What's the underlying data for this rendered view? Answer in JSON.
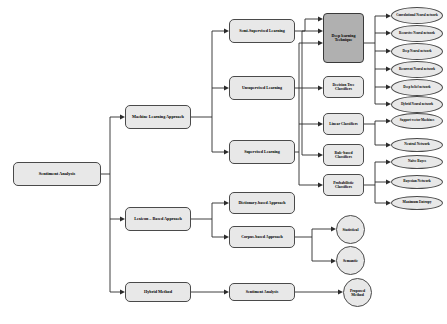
{
  "diagram": {
    "type": "tree",
    "background_color": "#ffffff",
    "node_fill": "#e8e8e8",
    "highlight_fill": "#b0b0b0",
    "border_color": "#4a4a4a"
  },
  "root": {
    "label": "Sentiment Analysis"
  },
  "approaches": [
    {
      "label": "Machine Learning Approach"
    },
    {
      "label": "Lexicon – Based Approach"
    },
    {
      "label": "Hybrid Method"
    }
  ],
  "learning_types": [
    {
      "label": "Semi-Supervised Learning"
    },
    {
      "label": "Unsupervised Learning"
    },
    {
      "label": "Supervised Learning"
    }
  ],
  "lexicon_methods": [
    {
      "label": "Dictionary-based Approach"
    },
    {
      "label": "Corpus-based Approach"
    }
  ],
  "hybrid_output": {
    "label": "Sentiment Analysis"
  },
  "classifiers": [
    {
      "label": "Deep learning Technique",
      "highlighted": true
    },
    {
      "label": "Decision Tree Classifiers",
      "highlighted": false
    },
    {
      "label": "Linear Classifiers",
      "highlighted": false
    },
    {
      "label": "Rule-based Classifiers",
      "highlighted": false
    },
    {
      "label": "Probabilistic Classifiers",
      "highlighted": false
    }
  ],
  "leaves": [
    {
      "label": "Convolutional Neural network"
    },
    {
      "label": "Recursive Neural network"
    },
    {
      "label": "Deep Neural network"
    },
    {
      "label": "Recurrent Neural network"
    },
    {
      "label": "Deep belief network"
    },
    {
      "label": "Hybrid Neural network"
    },
    {
      "label": "Support vector Machines"
    },
    {
      "label": "Neutral Network"
    },
    {
      "label": "Naïve Bayes"
    },
    {
      "label": "Bayesian Network"
    },
    {
      "label": "Maximum Entropy"
    }
  ],
  "lexicon_leaves": [
    {
      "label": "Statistical"
    },
    {
      "label": "Semantic"
    }
  ],
  "proposed": {
    "label": "Proposed Method"
  }
}
